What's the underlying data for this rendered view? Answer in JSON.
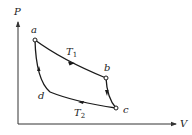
{
  "diagram": {
    "type": "PV cycle",
    "axes": {
      "y_label": "P",
      "x_label": "V"
    },
    "points": [
      {
        "name": "a",
        "label": "a"
      },
      {
        "name": "b",
        "label": "b"
      },
      {
        "name": "c",
        "label": "c"
      },
      {
        "name": "d",
        "label": "d"
      }
    ],
    "isotherms": {
      "upper": {
        "symbol": "T",
        "subscript": "1"
      },
      "lower": {
        "symbol": "T",
        "subscript": "2"
      }
    },
    "colors": {
      "line": "#1a1a1a",
      "axis": "#333333",
      "background": "#ffffff"
    }
  }
}
